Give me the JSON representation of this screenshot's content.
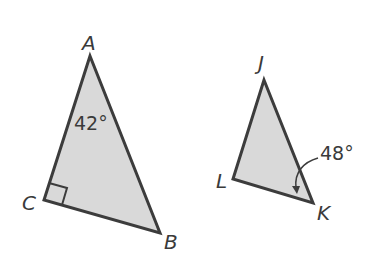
{
  "diagram": {
    "type": "geometry-triangles",
    "colors": {
      "fill": "#d9d9d9",
      "stroke": "#3c3c3c",
      "text": "#3a3a3a",
      "background": "#ffffff"
    },
    "triangles": [
      {
        "name": "ABC",
        "vertices": {
          "A": {
            "label": "A",
            "x": 90,
            "y": 56
          },
          "B": {
            "label": "B",
            "x": 160,
            "y": 233
          },
          "C": {
            "label": "C",
            "x": 44,
            "y": 200
          }
        },
        "right_angle_at": "C",
        "angle_label": {
          "vertex": "A",
          "text": "42°"
        }
      },
      {
        "name": "JKL",
        "vertices": {
          "J": {
            "label": "J",
            "x": 264,
            "y": 80
          },
          "K": {
            "label": "K",
            "x": 313,
            "y": 203
          },
          "L": {
            "label": "L",
            "x": 233,
            "y": 179
          }
        },
        "angle_label": {
          "vertex": "K",
          "text": "48°",
          "has_arrow": true
        }
      }
    ]
  }
}
